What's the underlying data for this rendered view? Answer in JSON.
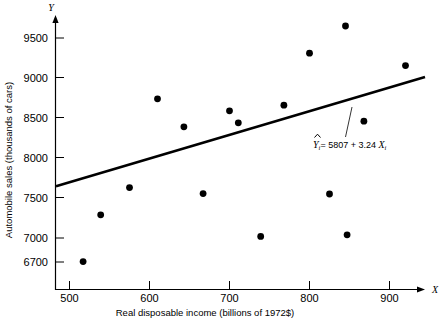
{
  "chart_data": {
    "type": "scatter",
    "title": "",
    "xlabel": "Real disposable income (billions of 1972$)",
    "ylabel": "Automobile sales (thousands of cars)",
    "x_axis_symbol": "X",
    "y_axis_symbol": "Y",
    "xlim": [
      480,
      935
    ],
    "ylim": [
      6600,
      9700
    ],
    "xticks": [
      500,
      600,
      700,
      800,
      900
    ],
    "xtick_labels": [
      "500",
      "600",
      "700",
      "800",
      "900"
    ],
    "yticks": [
      6700,
      7000,
      7500,
      8000,
      8500,
      9000,
      9500
    ],
    "ytick_labels": [
      "6700",
      "7000",
      "7500",
      "8000",
      "8500",
      "9000",
      "9500"
    ],
    "grid": false,
    "legend": false,
    "marker": "filled-circle",
    "marker_color": "#000000",
    "points": [
      {
        "x": 517,
        "y": 6705
      },
      {
        "x": 539,
        "y": 7290
      },
      {
        "x": 575,
        "y": 7630
      },
      {
        "x": 610,
        "y": 8740
      },
      {
        "x": 643,
        "y": 8390
      },
      {
        "x": 667,
        "y": 7555
      },
      {
        "x": 700,
        "y": 8590
      },
      {
        "x": 711,
        "y": 8440
      },
      {
        "x": 739,
        "y": 7020
      },
      {
        "x": 768,
        "y": 8660
      },
      {
        "x": 800,
        "y": 9310
      },
      {
        "x": 825,
        "y": 7550
      },
      {
        "x": 845,
        "y": 9650
      },
      {
        "x": 847,
        "y": 7040
      },
      {
        "x": 868,
        "y": 8460
      },
      {
        "x": 920,
        "y": 9155
      }
    ],
    "fit_line": {
      "intercept": 5807,
      "slope": 3.24,
      "x_start": 481,
      "x_end": 925,
      "label": "= 5807 + 3.24",
      "label_y_symbol": "Y",
      "label_y_sub": "i",
      "label_x_symbol": "X",
      "label_x_sub": "i",
      "full_label": "Yi = 5807 + 3.24 Xi"
    }
  }
}
